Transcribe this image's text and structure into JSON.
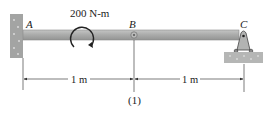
{
  "diagram": {
    "type": "beam",
    "moment_label": "200 N-m",
    "moment_direction": "clockwise",
    "points": {
      "A": "A",
      "B": "B",
      "C": "C"
    },
    "supports": {
      "A": "fixed-wall",
      "B": "internal-hinge",
      "C": "pin-support"
    },
    "dimensions": [
      {
        "label": "1 m",
        "from": "A",
        "to": "B"
      },
      {
        "label": "1 m",
        "from": "B",
        "to": "C"
      }
    ],
    "figure_number": "(1)",
    "colors": {
      "beam_fill": "#a9aaa9",
      "beam_edge": "#8a8b8a",
      "wall_fill": "#9e9f9e",
      "ground_fill": "#b5b6b5",
      "line": "#333333"
    }
  }
}
